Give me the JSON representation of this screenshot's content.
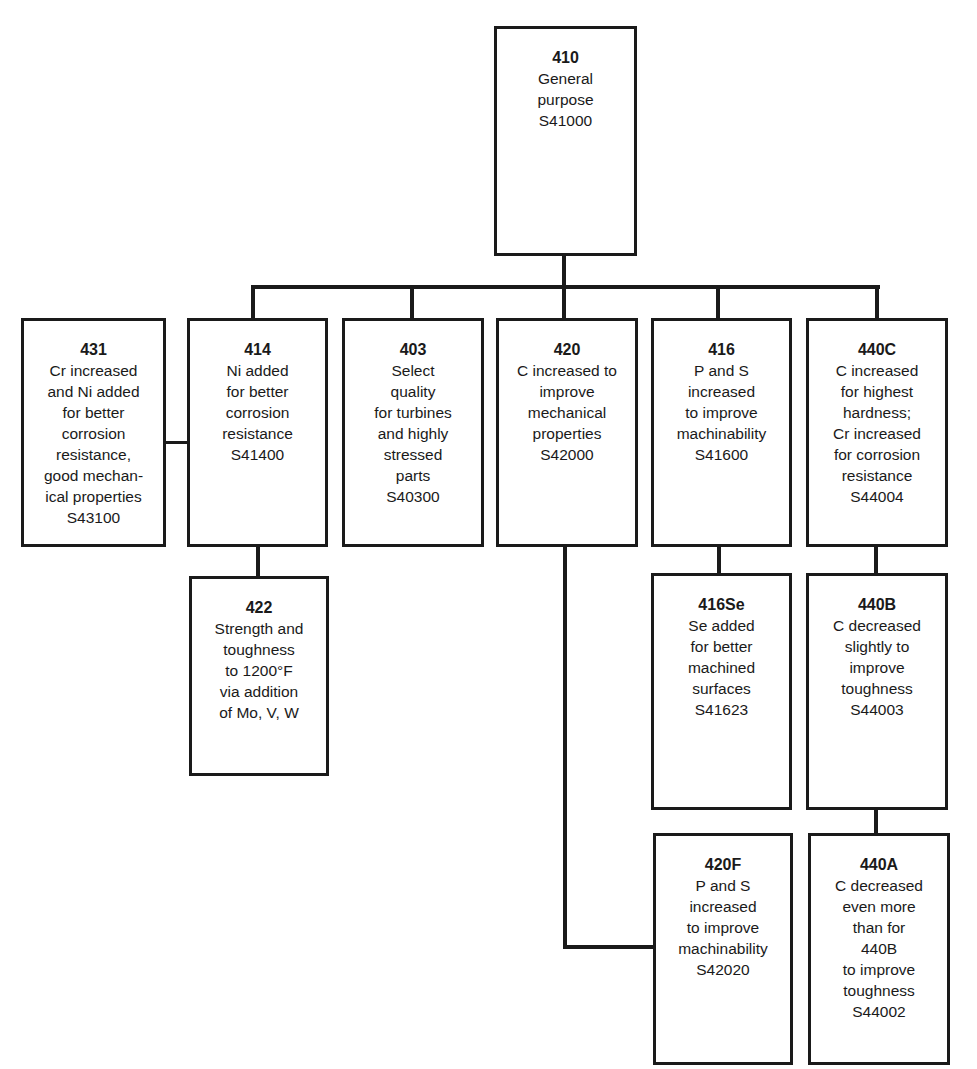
{
  "diagram": {
    "type": "tree",
    "nodes": {
      "n410": {
        "code": "410",
        "desc": "General\npurpose",
        "uns": "S41000"
      },
      "n431": {
        "code": "431",
        "desc": "Cr increased\nand Ni added\nfor better\ncorrosion\nresistance,\ngood mechan-\nical properties",
        "uns": "S43100"
      },
      "n414": {
        "code": "414",
        "desc": "Ni added\nfor better\ncorrosion\nresistance",
        "uns": "S41400"
      },
      "n403": {
        "code": "403",
        "desc": "Select\nquality\nfor turbines\nand highly\nstressed\nparts",
        "uns": "S40300"
      },
      "n420": {
        "code": "420",
        "desc": "C increased to\nimprove\nmechanical\nproperties",
        "uns": "S42000"
      },
      "n416": {
        "code": "416",
        "desc": "P and S\nincreased\nto improve\nmachinability",
        "uns": "S41600"
      },
      "n440C": {
        "code": "440C",
        "desc": "C increased\nfor highest\nhardness;\nCr increased\nfor corrosion\nresistance",
        "uns": "S44004"
      },
      "n422": {
        "code": "422",
        "desc": "Strength and\ntoughness\nto 1200°F\nvia addition\nof Mo, V, W",
        "uns": ""
      },
      "n416Se": {
        "code": "416Se",
        "desc": "Se added\nfor better\nmachined\nsurfaces",
        "uns": "S41623"
      },
      "n440B": {
        "code": "440B",
        "desc": "C decreased\nslightly to\nimprove\ntoughness",
        "uns": "S44003"
      },
      "n420F": {
        "code": "420F",
        "desc": "P and S\nincreased\nto improve\nmachinability",
        "uns": "S42020"
      },
      "n440A": {
        "code": "440A",
        "desc": "C decreased\neven more\nthan for\n440B\nto improve\ntoughness",
        "uns": "S44002"
      }
    },
    "edges": [
      [
        "410",
        "414"
      ],
      [
        "410",
        "403"
      ],
      [
        "410",
        "420"
      ],
      [
        "410",
        "416"
      ],
      [
        "410",
        "440C"
      ],
      [
        "414",
        "431"
      ],
      [
        "414",
        "422"
      ],
      [
        "420",
        "420F"
      ],
      [
        "416",
        "416Se"
      ],
      [
        "440C",
        "440B"
      ],
      [
        "440B",
        "440A"
      ]
    ],
    "colors": {
      "line": "#1a1a1a",
      "box_fill": "#ffffff",
      "background": "#ffffff"
    }
  }
}
